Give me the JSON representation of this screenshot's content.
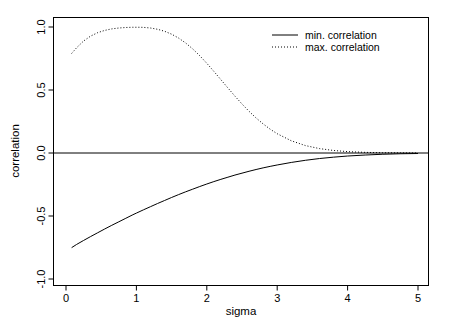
{
  "chart_data": {
    "type": "line",
    "title": "",
    "xlabel": "sigma",
    "ylabel": "correlation",
    "xlim": [
      -0.1,
      5.1
    ],
    "ylim": [
      -1.08,
      1.08
    ],
    "grid": false,
    "box": true,
    "xticks": [
      0,
      1,
      2,
      3,
      4,
      5
    ],
    "xticklabels": [
      "0",
      "1",
      "2",
      "3",
      "4",
      "5"
    ],
    "yticks": [
      -1.0,
      -0.5,
      0.0,
      0.5,
      1.0
    ],
    "yticklabels": [
      "-1.0",
      "-0.5",
      "0.0",
      "0.5",
      "1.0"
    ],
    "hline": 0.0,
    "legend": {
      "position": "top-right",
      "entries": [
        {
          "label": "min. correlation",
          "style": "solid",
          "color": "#000000"
        },
        {
          "label": "max. correlation",
          "style": "dotted",
          "color": "#000000"
        }
      ]
    },
    "series": [
      {
        "name": "min. correlation",
        "style": "solid",
        "color": "#000000",
        "x": [
          0.08,
          0.15,
          0.25,
          0.35,
          0.45,
          0.55,
          0.65,
          0.75,
          0.85,
          0.95,
          1.0,
          1.1,
          1.2,
          1.3,
          1.4,
          1.5,
          1.6,
          1.7,
          1.8,
          1.9,
          2.0,
          2.1,
          2.2,
          2.3,
          2.4,
          2.5,
          2.6,
          2.7,
          2.8,
          2.9,
          3.0,
          3.2,
          3.4,
          3.6,
          3.8,
          4.0,
          4.25,
          4.5,
          4.75,
          5.0
        ],
        "y": [
          -0.751,
          -0.726,
          -0.694,
          -0.663,
          -0.633,
          -0.603,
          -0.574,
          -0.546,
          -0.518,
          -0.49,
          -0.477,
          -0.451,
          -0.426,
          -0.401,
          -0.377,
          -0.353,
          -0.33,
          -0.308,
          -0.287,
          -0.266,
          -0.246,
          -0.227,
          -0.209,
          -0.192,
          -0.175,
          -0.16,
          -0.145,
          -0.131,
          -0.118,
          -0.106,
          -0.095,
          -0.075,
          -0.058,
          -0.044,
          -0.033,
          -0.024,
          -0.016,
          -0.01,
          -0.006,
          -0.004
        ]
      },
      {
        "name": "max. correlation",
        "style": "dotted",
        "color": "#000000",
        "x": [
          0.08,
          0.15,
          0.25,
          0.35,
          0.45,
          0.55,
          0.65,
          0.75,
          0.85,
          0.95,
          1.0,
          1.05,
          1.1,
          1.2,
          1.3,
          1.4,
          1.5,
          1.6,
          1.7,
          1.8,
          1.9,
          2.0,
          2.1,
          2.2,
          2.3,
          2.4,
          2.5,
          2.6,
          2.7,
          2.8,
          2.9,
          3.0,
          3.2,
          3.4,
          3.6,
          3.8,
          4.0,
          4.25,
          4.5,
          4.75,
          5.0
        ],
        "y": [
          0.79,
          0.835,
          0.889,
          0.928,
          0.955,
          0.973,
          0.985,
          0.992,
          0.996,
          0.998,
          0.998,
          0.998,
          0.997,
          0.992,
          0.982,
          0.966,
          0.943,
          0.912,
          0.873,
          0.826,
          0.772,
          0.712,
          0.648,
          0.582,
          0.516,
          0.451,
          0.389,
          0.331,
          0.278,
          0.231,
          0.189,
          0.153,
          0.097,
          0.059,
          0.035,
          0.02,
          0.011,
          0.005,
          0.002,
          0.001,
          0.0
        ]
      }
    ]
  },
  "axes": {
    "x_title": "sigma",
    "y_title": "correlation"
  }
}
